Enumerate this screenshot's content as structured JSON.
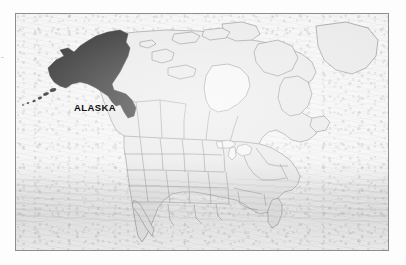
{
  "figure": {
    "kind": "reference-map",
    "frame": {
      "border_color": "#8e8e8e",
      "x": 15,
      "y": 13,
      "width": 374,
      "height": 238
    }
  },
  "labels": [
    {
      "id": "alaska-label",
      "text": "ALASKA",
      "x": 58,
      "y": 88,
      "style": "bold-caps"
    }
  ],
  "legend_implied": {
    "highlight_color": "#141414",
    "highlight_meaning": "ALASKA",
    "land_color": "#e7e7e7",
    "land_outline_color": "#6f6f6f",
    "background_color": "#f4f4f4"
  },
  "regions": [
    {
      "name": "Alaska",
      "highlighted": true,
      "fill": "#141414"
    },
    {
      "name": "Aleutian Islands",
      "highlighted": true,
      "fill": "#141414"
    },
    {
      "name": "Canada",
      "highlighted": false,
      "fill": "#e7e7e7"
    },
    {
      "name": "Canadian Arctic Archipelago",
      "highlighted": false,
      "fill": "#e7e7e7"
    },
    {
      "name": "Greenland (partial)",
      "highlighted": false,
      "fill": "#e7e7e7"
    },
    {
      "name": "Contiguous United States",
      "highlighted": false,
      "fill": "#e7e7e7"
    },
    {
      "name": "Mexico (northern, partial)",
      "highlighted": false,
      "fill": "#e7e7e7"
    }
  ],
  "features": {
    "state_borders_visible": true,
    "province_borders_visible": true,
    "hudson_bay_visible": true,
    "great_lakes_visible": true,
    "florida_peninsula_visible": true,
    "baja_california_visible": true,
    "paper_texture": "mottled-gray-scan"
  }
}
